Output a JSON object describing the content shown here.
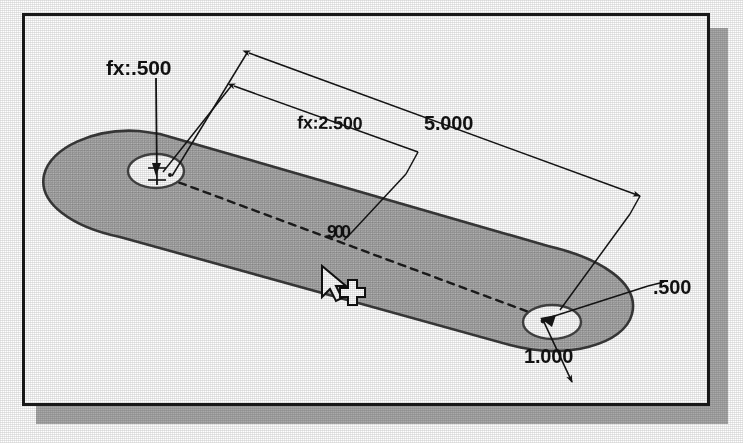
{
  "app": {
    "kind": "cad-sketch-viewport",
    "background_color": "#ffffff",
    "frame_border_color": "#1a1a1a",
    "frame_shadow_color": "#a9a9a9"
  },
  "part": {
    "name": "slotted-link-plate",
    "face_fill_color": "#a8a8a8",
    "face_edge_color": "#3a3a3a",
    "hole_fill_color": "#fdfdfd",
    "hole_edge_color": "#444444",
    "centerline_style": "dashed",
    "centerline_color": "#1c1c1c"
  },
  "dimensions": [
    {
      "id": "hole-left-diameter",
      "label": "fx:.500",
      "driven_by_equation": true,
      "x": 106,
      "y": 58
    },
    {
      "id": "hole-spacing",
      "label": "fx:2.500",
      "driven_by_equation": true,
      "x": 297,
      "y": 114
    },
    {
      "id": "overall-length",
      "label": "5.000",
      "driven_by_equation": false,
      "x": 425,
      "y": 115
    },
    {
      "id": "offset-dim",
      "label": ".900",
      "driven_by_equation": false,
      "x": 327,
      "y": 224
    },
    {
      "id": "hole-right-diameter",
      "label": ".500",
      "driven_by_equation": false,
      "x": 653,
      "y": 279
    },
    {
      "id": "edge-distance",
      "label": "1.000",
      "driven_by_equation": false,
      "x": 525,
      "y": 348
    }
  ],
  "cursor": {
    "name": "sketch-cursor",
    "pointer_x": 322,
    "pointer_y": 268,
    "crosshair_x": 344,
    "crosshair_y": 292
  }
}
